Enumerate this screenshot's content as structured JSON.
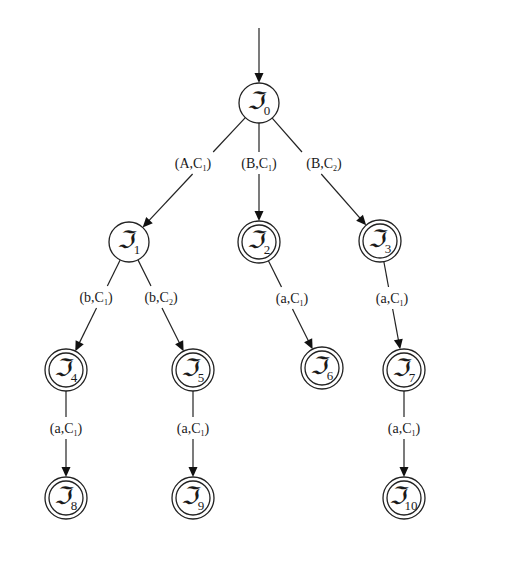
{
  "diagram": {
    "type": "state-tree",
    "colors": {
      "stroke": "#222222",
      "background": "#ffffff",
      "text": "#1a1a1a"
    },
    "node_symbol": "ℑ",
    "start_arrow": {
      "from": [
        259,
        28
      ],
      "to_node": "0"
    },
    "nodes": [
      {
        "id": "0",
        "x": 259,
        "y": 103,
        "final": false
      },
      {
        "id": "1",
        "x": 129,
        "y": 242,
        "final": false
      },
      {
        "id": "2",
        "x": 259,
        "y": 242,
        "final": true
      },
      {
        "id": "3",
        "x": 380,
        "y": 241,
        "final": true
      },
      {
        "id": "4",
        "x": 66,
        "y": 370,
        "final": true
      },
      {
        "id": "5",
        "x": 193,
        "y": 370,
        "final": true
      },
      {
        "id": "6",
        "x": 322,
        "y": 368,
        "final": true
      },
      {
        "id": "7",
        "x": 404,
        "y": 370,
        "final": true
      },
      {
        "id": "8",
        "x": 66,
        "y": 498,
        "final": true
      },
      {
        "id": "9",
        "x": 193,
        "y": 498,
        "final": true
      },
      {
        "id": "10",
        "x": 404,
        "y": 498,
        "final": true
      }
    ],
    "edges": [
      {
        "from": "0",
        "to": "1",
        "label_main": "(A,C",
        "label_sub": "1",
        "label_x": 193,
        "label_y": 168
      },
      {
        "from": "0",
        "to": "2",
        "label_main": "(B,C",
        "label_sub": "1",
        "label_x": 259,
        "label_y": 168
      },
      {
        "from": "0",
        "to": "3",
        "label_main": "(B,C",
        "label_sub": "2",
        "label_x": 324,
        "label_y": 168
      },
      {
        "from": "1",
        "to": "4",
        "label_main": "(b,C",
        "label_sub": "1",
        "label_x": 96,
        "label_y": 302
      },
      {
        "from": "1",
        "to": "5",
        "label_main": "(b,C",
        "label_sub": "2",
        "label_x": 161,
        "label_y": 302
      },
      {
        "from": "2",
        "to": "6",
        "label_main": "(a,C",
        "label_sub": "1",
        "label_x": 292,
        "label_y": 303
      },
      {
        "from": "3",
        "to": "7",
        "label_main": "(a,C",
        "label_sub": "1",
        "label_x": 392,
        "label_y": 303
      },
      {
        "from": "4",
        "to": "8",
        "label_main": "(a,C",
        "label_sub": "1",
        "label_x": 66,
        "label_y": 433
      },
      {
        "from": "5",
        "to": "9",
        "label_main": "(a,C",
        "label_sub": "1",
        "label_x": 193,
        "label_y": 433
      },
      {
        "from": "7",
        "to": "10",
        "label_main": "(a,C",
        "label_sub": "1",
        "label_x": 404,
        "label_y": 433
      }
    ],
    "labels": {
      "node_0": "ℑ0",
      "node_1": "ℑ1",
      "node_2": "ℑ2",
      "node_3": "ℑ3",
      "node_4": "ℑ4",
      "node_5": "ℑ5",
      "node_6": "ℑ6",
      "node_7": "ℑ7",
      "node_8": "ℑ8",
      "node_9": "ℑ9",
      "node_10": "ℑ10",
      "edge_0_1": "(A,C1)",
      "edge_0_2": "(B,C1)",
      "edge_0_3": "(B,C2)",
      "edge_1_4": "(b,C1)",
      "edge_1_5": "(b,C2)",
      "edge_2_6": "(a,C1)",
      "edge_3_7": "(a,C1)",
      "edge_4_8": "(a,C1)",
      "edge_5_9": "(a,C1)",
      "edge_7_10": "(a,C1)"
    }
  }
}
